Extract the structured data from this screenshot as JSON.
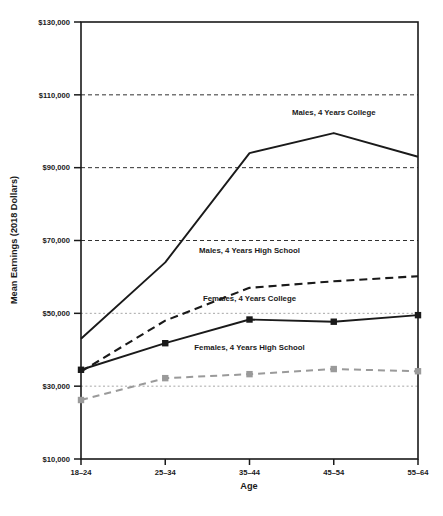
{
  "chart_data": {
    "type": "line",
    "title": "",
    "xlabel": "Age",
    "ylabel": "Mean Earnings (2018 Dollars)",
    "categories": [
      "18–24",
      "25–34",
      "35–44",
      "45–54",
      "55–64"
    ],
    "ylim": [
      10000,
      130000
    ],
    "ytick_values": [
      10000,
      30000,
      50000,
      70000,
      90000,
      110000,
      130000
    ],
    "ytick_labels": [
      "$10,000",
      "$30,000",
      "$50,000",
      "$70,000",
      "$90,000",
      "$110,000",
      "$130,000"
    ],
    "grid": "horizontal-dashed",
    "legend_position": "inline-annotations",
    "series": [
      {
        "name": "Males, 4 Years College",
        "values": [
          43000,
          64000,
          94000,
          99500,
          93000
        ],
        "style": "solid",
        "color": "#1a1a1a",
        "markers": false,
        "label_x_category": "45–54",
        "label_value": 104500
      },
      {
        "name": "Males, 4 Years High School",
        "values": [
          34000,
          48000,
          57000,
          58800,
          60200
        ],
        "style": "dashed",
        "color": "#1a1a1a",
        "markers": false,
        "label_x_category": "35–44",
        "label_value": 66500
      },
      {
        "name": "Females, 4 Years College",
        "values": [
          34500,
          41800,
          48300,
          47700,
          49500
        ],
        "style": "solid",
        "color": "#1a1a1a",
        "markers": true,
        "label_x_category": "35–44",
        "label_value": 53500
      },
      {
        "name": "Females, 4 Years High School",
        "values": [
          26200,
          32200,
          33300,
          34700,
          34100
        ],
        "style": "dashed",
        "color": "#9a9a9a",
        "markers": true,
        "label_x_category": "35–44",
        "label_value": 39800
      }
    ]
  },
  "caption": {
    "text": ""
  }
}
